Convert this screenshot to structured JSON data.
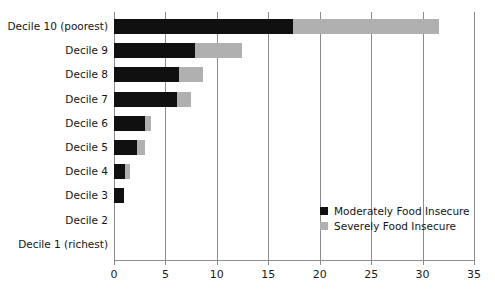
{
  "chart_data": {
    "type": "bar",
    "orientation": "horizontal",
    "stacked": true,
    "title": "",
    "subtitle": "",
    "xlabel": "",
    "ylabel": "",
    "xlim": [
      0,
      35
    ],
    "xticks": [
      0,
      5,
      10,
      15,
      20,
      25,
      30,
      35
    ],
    "xtick_labels": [
      "0",
      "5",
      "10",
      "15",
      "20",
      "25",
      "30",
      "35"
    ],
    "grid": "vertical",
    "legend_position": "inside-right-lower",
    "categories": [
      "Decile 10 (poorest)",
      "Decile 9",
      "Decile 8",
      "Decile 7",
      "Decile 6",
      "Decile 5",
      "Decile 4",
      "Decile 3",
      "Decile 2",
      "Decile 1 (richest)"
    ],
    "series": [
      {
        "name": "Moderately Food Insecure",
        "color": "#101010",
        "values": [
          17.4,
          7.9,
          6.3,
          6.1,
          3.0,
          2.2,
          1.1,
          1.0,
          0,
          0
        ]
      },
      {
        "name": "Severely Food Insecure",
        "color": "#b0b0b0",
        "values": [
          14.2,
          4.5,
          2.4,
          1.4,
          0.6,
          0.8,
          0.5,
          0,
          0,
          0
        ]
      }
    ],
    "totals": [
      31.6,
      12.4,
      8.7,
      7.5,
      3.6,
      3.0,
      1.6,
      1.0,
      0,
      0
    ]
  },
  "legend": {
    "items": [
      {
        "label": "Moderately Food Insecure",
        "color": "#101010"
      },
      {
        "label": "Severely Food Insecure",
        "color": "#b0b0b0"
      }
    ]
  },
  "colors": {
    "moderate": "#101010",
    "severe": "#b0b0b0",
    "axis": "#8c8c8c",
    "text": "#141414",
    "background": "#ffffff"
  }
}
